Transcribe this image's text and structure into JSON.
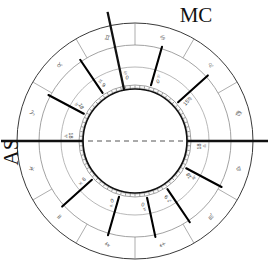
{
  "chart_data": {
    "type": "pie",
    "center": {
      "x": 135,
      "y": 141
    },
    "radii": {
      "outer": 118,
      "zodiac_inner": 96,
      "house_ring": 74,
      "disc_outer": 56,
      "disc_inner": 52
    },
    "axes": [
      {
        "name": "MC",
        "label": "MC",
        "angle_deg": 78,
        "label_x": 196,
        "label_y": 22
      },
      {
        "name": "AS",
        "label": "AS",
        "angle_deg": 180,
        "label_x": 18,
        "label_y": 152
      }
    ],
    "horizon_line": {
      "style": "dashed",
      "from_angle": 180,
      "to_angle": 0
    },
    "house_cusps": [
      {
        "house": 1,
        "angle_deg": 180.0,
        "degree_label": "18",
        "sign_glyph": "♎"
      },
      {
        "house": 2,
        "angle_deg": 208.0,
        "degree_label": "18",
        "sign_glyph": "♏"
      },
      {
        "house": 3,
        "angle_deg": 236.0,
        "degree_label": "9",
        "sign_glyph": "♐"
      },
      {
        "house": 4,
        "angle_deg": 258.0,
        "degree_label": "0",
        "sign_glyph": "♑"
      },
      {
        "house": 5,
        "angle_deg": 286.0,
        "degree_label": "0",
        "sign_glyph": "♒"
      },
      {
        "house": 6,
        "angle_deg": 318.0,
        "degree_label": "9",
        "sign_glyph": "♓"
      },
      {
        "house": 7,
        "angle_deg": 0.0,
        "degree_label": "18",
        "sign_glyph": "♈"
      },
      {
        "house": 8,
        "angle_deg": 28.0,
        "degree_label": "18",
        "sign_glyph": "♉"
      },
      {
        "house": 9,
        "angle_deg": 56.0,
        "degree_label": "9",
        "sign_glyph": "♊"
      },
      {
        "house": 10,
        "angle_deg": 78.0,
        "degree_label": "0",
        "sign_glyph": "♋"
      },
      {
        "house": 11,
        "angle_deg": 106.0,
        "degree_label": "0",
        "sign_glyph": "♌"
      },
      {
        "house": 12,
        "angle_deg": 138.0,
        "degree_label": "15",
        "sign_glyph": "♍"
      }
    ],
    "zodiac_signs": [
      {
        "name": "Aries",
        "glyph": "♈",
        "start_deg": 0
      },
      {
        "name": "Taurus",
        "glyph": "♉",
        "start_deg": 30
      },
      {
        "name": "Gemini",
        "glyph": "♊",
        "start_deg": 60
      },
      {
        "name": "Cancer",
        "glyph": "♋",
        "start_deg": 90
      },
      {
        "name": "Leo",
        "glyph": "♌",
        "start_deg": 120
      },
      {
        "name": "Virgo",
        "glyph": "♍",
        "start_deg": 150
      },
      {
        "name": "Libra",
        "glyph": "♎",
        "start_deg": 180
      },
      {
        "name": "Scorpio",
        "glyph": "♏",
        "start_deg": 210
      },
      {
        "name": "Sagittarius",
        "glyph": "♐",
        "start_deg": 240
      },
      {
        "name": "Capricorn",
        "glyph": "♑",
        "start_deg": 270
      },
      {
        "name": "Aquarius",
        "glyph": "♒",
        "start_deg": 300
      },
      {
        "name": "Pisces",
        "glyph": "♓",
        "start_deg": 330
      }
    ],
    "degree_scale": {
      "ticks": 360,
      "major_every": 5,
      "ring": "disc_outer"
    },
    "colors": {
      "background": "#ffffff",
      "line": "#111111",
      "ring_line": "#6f6f6f",
      "cusp_line": "#000000",
      "text": "#222222",
      "tick": "#333333"
    }
  }
}
